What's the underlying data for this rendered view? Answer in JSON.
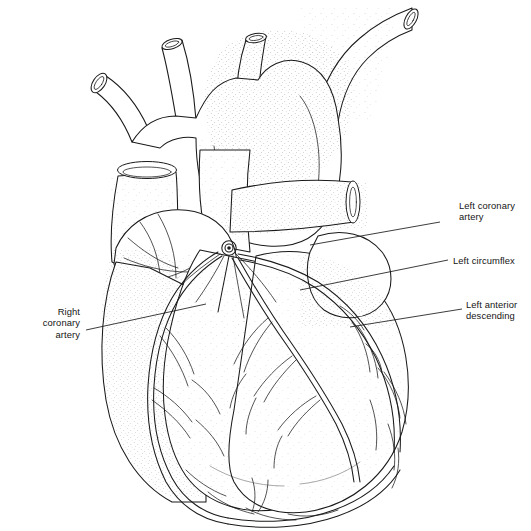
{
  "figure": {
    "background_color": "#ffffff",
    "ink_color": "#1a1a1a",
    "width": 531,
    "height": 531
  },
  "labels": [
    {
      "id": "left-coronary-artery",
      "text": "Left coronary\nartery",
      "side": "right",
      "leader": {
        "x1": 440,
        "y1": 222,
        "x2": 310,
        "y2": 245
      }
    },
    {
      "id": "left-circumflex",
      "text": "Left circumflex",
      "side": "right",
      "leader": {
        "x1": 448,
        "y1": 260,
        "x2": 300,
        "y2": 290
      }
    },
    {
      "id": "left-anterior-descending",
      "text": "Left anterior\ndescending",
      "side": "right",
      "leader": {
        "x1": 462,
        "y1": 309,
        "x2": 350,
        "y2": 327
      }
    },
    {
      "id": "right-coronary-artery",
      "text": "Right\ncoronary\nartery",
      "side": "left",
      "leader": {
        "x1": 86,
        "y1": 330,
        "x2": 206,
        "y2": 304
      }
    }
  ],
  "structures": [
    {
      "id": "aortic-arch",
      "name": "aortic arch"
    },
    {
      "id": "brachiocephalic-trunk",
      "name": "brachiocephalic trunk"
    },
    {
      "id": "left-common-carotid-artery",
      "name": "left common carotid artery"
    },
    {
      "id": "left-subclavian-artery",
      "name": "left subclavian artery"
    },
    {
      "id": "descending-aorta",
      "name": "descending aorta"
    },
    {
      "id": "superior-vena-cava",
      "name": "superior vena cava"
    },
    {
      "id": "right-pulmonary-artery",
      "name": "right pulmonary artery"
    },
    {
      "id": "pulmonary-trunk",
      "name": "pulmonary trunk"
    },
    {
      "id": "right-atrial-appendage",
      "name": "right atrial appendage"
    },
    {
      "id": "left-atrial-appendage",
      "name": "left atrial appendage"
    },
    {
      "id": "right-ventricle",
      "name": "right ventricle"
    },
    {
      "id": "left-ventricle",
      "name": "left ventricle"
    },
    {
      "id": "coronary-ostium",
      "name": "coronary ostium"
    },
    {
      "id": "cardiac-apex",
      "name": "cardiac apex"
    }
  ]
}
